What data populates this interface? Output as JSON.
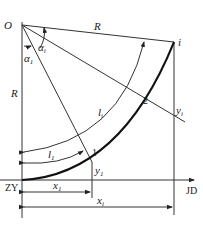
{
  "diagram": {
    "type": "circular-curve-tangent-offset-layout",
    "labels": {
      "origin": "O",
      "radius_top": "R",
      "radius_left": "R",
      "point_i": "i",
      "point_1": "1",
      "point_2": "2",
      "alpha_i": "α",
      "alpha_i_sub": "i",
      "alpha_1": "α",
      "alpha_1_sub": "1",
      "arc_li": "l",
      "arc_li_sub": "i",
      "arc_l1": "l",
      "arc_l1_sub": "1",
      "y_i": "y",
      "y_i_sub": "i",
      "y_1": "y",
      "y_1_sub": "1",
      "x_1": "x",
      "x_1_sub": "1",
      "x_i": "x",
      "x_i_sub": "i",
      "start": "ZY",
      "end": "JD"
    },
    "colors": {
      "line": "#333333",
      "curve": "#111111",
      "background": "#ffffff"
    }
  }
}
